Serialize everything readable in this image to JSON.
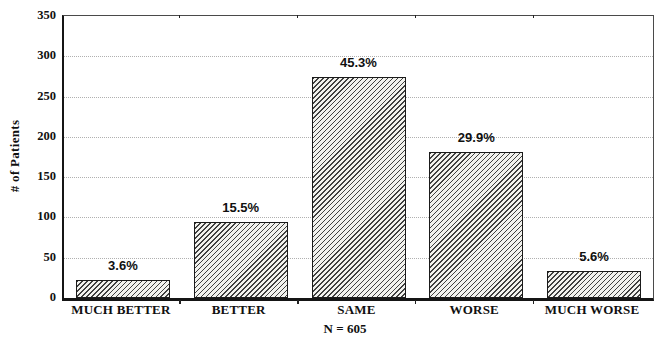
{
  "chart_data": {
    "type": "bar",
    "title": "",
    "ylabel": "# of Patients",
    "xlabel": "",
    "footnote": "N = 605",
    "total_n": 605,
    "categories": [
      "MUCH BETTER",
      "BETTER",
      "SAME",
      "WORSE",
      "MUCH WORSE"
    ],
    "values": [
      22,
      94,
      274,
      181,
      34
    ],
    "percent_labels": [
      "3.6%",
      "15.5%",
      "45.3%",
      "29.9%",
      "5.6%"
    ],
    "ylim": [
      0,
      350
    ],
    "yticks": [
      0,
      50,
      100,
      150,
      200,
      250,
      300,
      350
    ],
    "grid": "horizontal-dotted",
    "legend": "none",
    "bar_style": "diagonal-hatch"
  },
  "colors": {
    "background": "#ffffff",
    "axis": "#151515",
    "grid": "#b0b0b0",
    "text": "#101010",
    "bar_fill": "#f2f2ee",
    "bar_hatch": "#3f3f3f",
    "bar_border": "#1a1a1a"
  }
}
